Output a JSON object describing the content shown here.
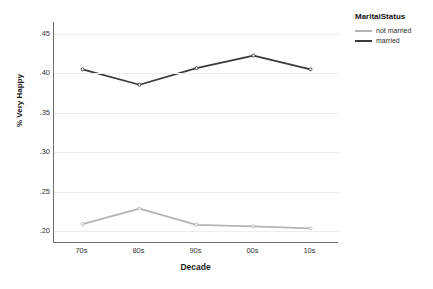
{
  "chart_data": {
    "type": "line",
    "title": "",
    "xlabel": "Decade",
    "ylabel": "% Very Happy",
    "categories": [
      "70s",
      "80s",
      "90s",
      "00s",
      "10s"
    ],
    "ylim": [
      0.185,
      0.465
    ],
    "yticks": [
      ".45",
      ".40",
      ".35",
      ".30",
      ".25",
      ".20"
    ],
    "ytick_values": [
      0.45,
      0.4,
      0.35,
      0.3,
      0.25,
      0.2
    ],
    "grid": true,
    "legend_position": "right",
    "legend_title": "MaritalStatus",
    "series": [
      {
        "name": "not married",
        "color": "#b4b4b4",
        "values": [
          0.209,
          0.2285,
          0.208,
          0.206,
          0.2035
        ]
      },
      {
        "name": "married",
        "color": "#3a3a3a",
        "values": [
          0.405,
          0.3855,
          0.4065,
          0.4225,
          0.405
        ]
      }
    ]
  },
  "colors": {
    "background": "#ffffff",
    "axis": "#6e6e6e",
    "gridline": "#ededed",
    "not_married": "#b4b4b4",
    "married": "#3a3a3a"
  }
}
